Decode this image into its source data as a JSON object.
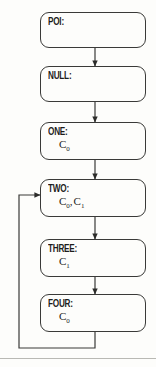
{
  "diagram": {
    "type": "state-flowchart",
    "orientation": "vertical",
    "canvas": {
      "width": 156,
      "height": 367
    },
    "colors": {
      "background": "#fdfdfb",
      "stroke": "#3a3a38",
      "text": "#1d1d1b",
      "rule": "#b9b9b4"
    },
    "nodes": [
      {
        "id": "poi",
        "label": "POI:",
        "symbols": [],
        "box": {
          "x": 40,
          "y": 12,
          "w": 106,
          "h": 36
        }
      },
      {
        "id": "null",
        "label": "NULL:",
        "symbols": [],
        "box": {
          "x": 40,
          "y": 66,
          "w": 106,
          "h": 36
        }
      },
      {
        "id": "one",
        "label": "ONE:",
        "symbols": [
          {
            "base": "C",
            "sub": "0"
          }
        ],
        "box": {
          "x": 40,
          "y": 122,
          "w": 106,
          "h": 38
        }
      },
      {
        "id": "two",
        "label": "TWO:",
        "symbols": [
          {
            "base": "C",
            "sub": "0"
          },
          {
            "base": "C",
            "sub": "1"
          }
        ],
        "box": {
          "x": 40,
          "y": 179,
          "w": 106,
          "h": 38
        }
      },
      {
        "id": "three",
        "label": "THREE:",
        "symbols": [
          {
            "base": "C",
            "sub": "1"
          }
        ],
        "box": {
          "x": 40,
          "y": 239,
          "w": 106,
          "h": 38
        }
      },
      {
        "id": "four",
        "label": "FOUR:",
        "symbols": [
          {
            "base": "C",
            "sub": "0"
          }
        ],
        "box": {
          "x": 40,
          "y": 294,
          "w": 106,
          "h": 38
        }
      }
    ],
    "connectors": [
      {
        "id": "poi-to-null",
        "from": "poi",
        "to": "null",
        "kind": "arrow-down",
        "x": 95,
        "y1": 48,
        "y2": 66
      },
      {
        "id": "null-to-one",
        "from": "null",
        "to": "one",
        "kind": "arrow-down",
        "x": 95,
        "y1": 102,
        "y2": 122
      },
      {
        "id": "one-to-two",
        "from": "one",
        "to": "two",
        "kind": "arrow-down",
        "x": 95,
        "y1": 160,
        "y2": 179
      },
      {
        "id": "two-to-three",
        "from": "two",
        "to": "three",
        "kind": "arrow-down",
        "x": 95,
        "y1": 217,
        "y2": 239
      },
      {
        "id": "three-to-four",
        "from": "three",
        "to": "four",
        "kind": "arrow-down",
        "x": 95,
        "y1": 277,
        "y2": 294
      }
    ],
    "feedback_loop": {
      "id": "four-to-two-loop",
      "from": "four",
      "to": "two",
      "kind": "arrow-left-up-right",
      "path": "M 95 332 L 95 348 L 19 348 L 19 195 L 40 195"
    },
    "footer_rule": {
      "y": 358
    }
  }
}
